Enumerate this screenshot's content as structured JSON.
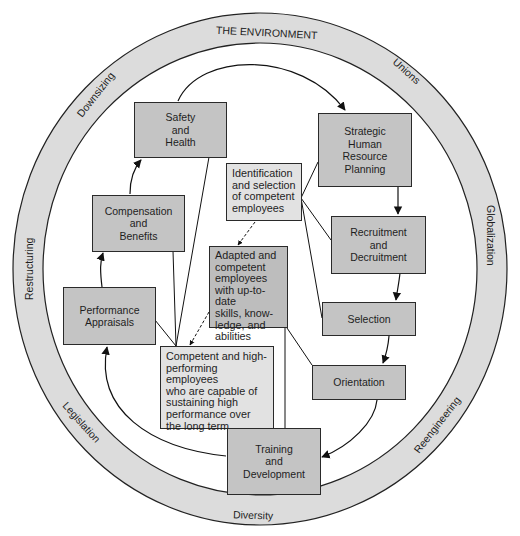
{
  "environment": {
    "title": "THE ENVIRONMENT",
    "forces": [
      {
        "label": "THE ENVIRONMENT",
        "position": "top"
      },
      {
        "label": "Unions",
        "position": "upper-right"
      },
      {
        "label": "Globalization",
        "position": "right"
      },
      {
        "label": "Reengineering",
        "position": "lower-right"
      },
      {
        "label": "Diversity",
        "position": "bottom"
      },
      {
        "label": "Legislation",
        "position": "lower-left"
      },
      {
        "label": "Restructuring",
        "position": "left"
      },
      {
        "label": "Downsizing",
        "position": "upper-left"
      }
    ],
    "ring_fill": "#dcdcdc"
  },
  "process_steps": {
    "strategic_hrp": "Strategic\nHuman\nResource\nPlanning",
    "recruitment": "Recruitment\nand\nDecruitment",
    "selection": "Selection",
    "orientation": "Orientation",
    "training": "Training\nand\nDevelopment",
    "performance": "Performance\nAppraisals",
    "compensation": "Compensation\nand\nBenefits",
    "safety": "Safety\nand\nHealth"
  },
  "outcomes": {
    "identification": "Identification\nand selection\nof competent\nemployees",
    "adapted": "Adapted and\ncompetent\nemployees\nwith up-to-date\nskills, know-\nledge, and\nabilities",
    "competent": "Competent and high-\nperforming employees\nwho are capable of\nsustaining high\nperformance over\nthe long term"
  },
  "colors": {
    "step_box": "#c4c4c4",
    "outcome_box_light": "#e2e2e2",
    "outcome_box_mid": "#bdbdbd",
    "stroke": "#2a2a2a"
  }
}
